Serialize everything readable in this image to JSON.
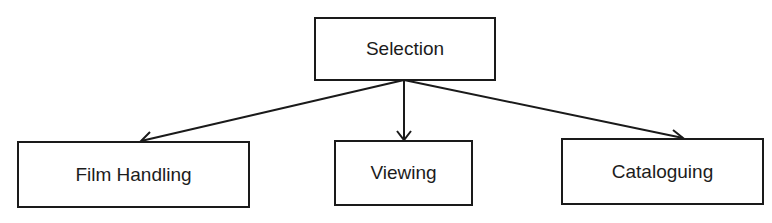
{
  "diagram": {
    "type": "tree",
    "root": {
      "id": "selection",
      "label": "Selection"
    },
    "children": [
      {
        "id": "film-handling",
        "label": "Film Handling"
      },
      {
        "id": "viewing",
        "label": "Viewing"
      },
      {
        "id": "cataloguing",
        "label": "Cataloguing"
      }
    ],
    "edges": [
      {
        "from": "selection",
        "to": "film-handling"
      },
      {
        "from": "selection",
        "to": "viewing"
      },
      {
        "from": "selection",
        "to": "cataloguing"
      }
    ],
    "colors": {
      "line": "#1a1a1a",
      "text": "#1c1c1c",
      "background": "#ffffff"
    }
  }
}
